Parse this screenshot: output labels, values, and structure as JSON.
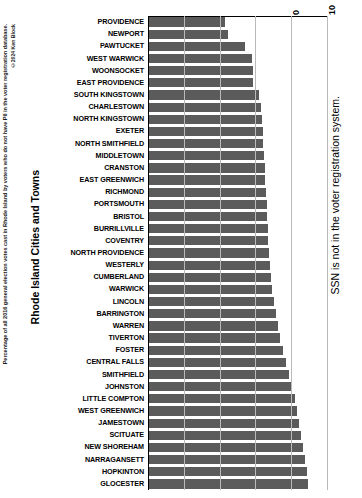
{
  "chart_data": {
    "type": "bar",
    "orientation": "horizontal",
    "title": "",
    "xlabel": "",
    "ylabel": "Rhode Island Cities and Towns",
    "xlim": [
      0,
      50
    ],
    "xticks": [
      0,
      10,
      20,
      30,
      40,
      50
    ],
    "grid": true,
    "legend": null,
    "bar_color": "#5b5b5b",
    "categories": [
      "PROVIDENCE",
      "NEWPORT",
      "PAWTUCKET",
      "WEST WARWICK",
      "WOONSOCKET",
      "EAST PROVIDENCE",
      "SOUTH KINGSTOWN",
      "CHARLESTOWN",
      "NORTH KINGSTOWN",
      "EXETER",
      "NORTH SMITHFIELD",
      "MIDDLETOWN",
      "CRANSTON",
      "EAST GREENWICH",
      "RICHMOND",
      "PORTSMOUTH",
      "BRISTOL",
      "BURRILLVILLE",
      "COVENTRY",
      "NORTH PROVIDENCE",
      "WESTERLY",
      "CUMBERLAND",
      "WARWICK",
      "LINCOLN",
      "BARRINGTON",
      "WARREN",
      "TIVERTON",
      "FOSTER",
      "CENTRAL FALLS",
      "SMITHFIELD",
      "JOHNSTON",
      "LITTLE COMPTON",
      "WEST GREENWICH",
      "JAMESTOWN",
      "SCITUATE",
      "NEW SHOREHAM",
      "NARRAGANSETT",
      "HOPKINTON",
      "GLOCESTER"
    ],
    "values": [
      21.6,
      22.4,
      27.2,
      29.0,
      29.2,
      29.3,
      31.0,
      31.5,
      31.8,
      32.0,
      32.2,
      32.4,
      32.6,
      32.8,
      33.0,
      33.2,
      33.3,
      33.5,
      33.6,
      33.8,
      34.0,
      34.3,
      34.6,
      35.2,
      35.8,
      36.4,
      37.0,
      37.8,
      38.6,
      39.4,
      40.2,
      41.0,
      41.6,
      42.2,
      42.8,
      43.4,
      43.9,
      44.4,
      44.6
    ]
  },
  "annotations": {
    "right_note": "SSN is not in the voter registration system."
  },
  "caption": {
    "main": "Percentage of all 2016 general election votes cast in Rhode Island by voters who do not have PII in the voter registration database.",
    "copyright": "©2024 Ken Block"
  }
}
